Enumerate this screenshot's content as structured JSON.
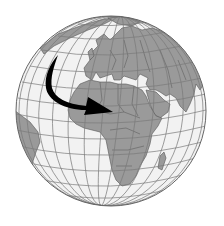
{
  "figure": {
    "description": "Globe illustration centered on Africa and Europe with a black curved arrow sweeping from the North Atlantic down toward North Africa (Sahara region)",
    "colors": {
      "background": "#ffffff",
      "ocean": "#f2f2f2",
      "land": "#9a9a9a",
      "borders": "#555555",
      "graticule": "#7a7a7a",
      "arrow": "#000000",
      "outline": "#666666"
    },
    "globe": {
      "cx": 111,
      "cy": 111,
      "r": 95
    },
    "arrow": {
      "start": [
        58,
        55
      ],
      "tip": [
        113,
        112
      ],
      "direction": "southeast-curving-east"
    },
    "regions_visible": [
      "Europe",
      "Africa",
      "Middle East",
      "Arabian Peninsula",
      "Western Asia",
      "South America (east coast)",
      "Greenland edge",
      "Madagascar"
    ]
  }
}
